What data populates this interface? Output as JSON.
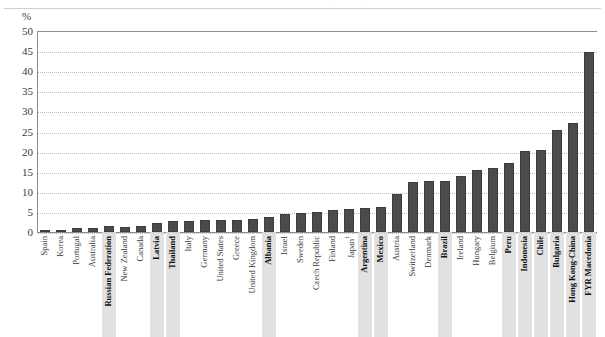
{
  "axis": {
    "y_unit_label": "%",
    "y_ticks": [
      0,
      5,
      10,
      15,
      20,
      25,
      30,
      35,
      40,
      45,
      50
    ]
  },
  "chart_data": {
    "type": "bar",
    "title": "",
    "xlabel": "",
    "ylabel": "%",
    "ylim": [
      0,
      50
    ],
    "grid": true,
    "legend": "none",
    "bar_color": "#4b4b4b",
    "highlight_color": "#dcdcdc",
    "categories": [
      "Spain",
      "Korea",
      "Portugal",
      "Australia",
      "Russian Federation",
      "New Zealand",
      "Canada",
      "Latvia",
      "Thailand",
      "Italy",
      "Germany",
      "United States",
      "Greece",
      "United Kingdom",
      "Albania",
      "Israel",
      "Sweden",
      "Czech Republic",
      "Finland",
      "Japan¹",
      "Argentina",
      "Mexico",
      "Austria",
      "Switzerland",
      "Denmark",
      "Brazil",
      "Ireland",
      "Hungary",
      "Belgium",
      "Peru",
      "Indonesia",
      "Chile",
      "Bulgaria",
      "Hong Kong-China",
      "FYR Macedonia"
    ],
    "values": [
      0.4,
      0.4,
      1.1,
      1.1,
      1.5,
      1.3,
      1.4,
      2.2,
      2.7,
      2.7,
      3.0,
      3.0,
      3.1,
      3.3,
      3.7,
      4.6,
      4.8,
      5.1,
      5.4,
      5.7,
      5.9,
      6.2,
      9.4,
      12.5,
      12.7,
      12.8,
      13.9,
      15.4,
      15.8,
      17.2,
      20.2,
      20.4,
      25.4,
      25.6,
      27.1
    ],
    "extra_value": 44.8,
    "highlighted": [
      "Russian Federation",
      "Latvia",
      "Thailand",
      "Albania",
      "Argentina",
      "Mexico",
      "Brazil",
      "Peru",
      "Indonesia",
      "Chile",
      "Bulgaria",
      "Hong Kong-China",
      "FYR Macedonia"
    ]
  }
}
